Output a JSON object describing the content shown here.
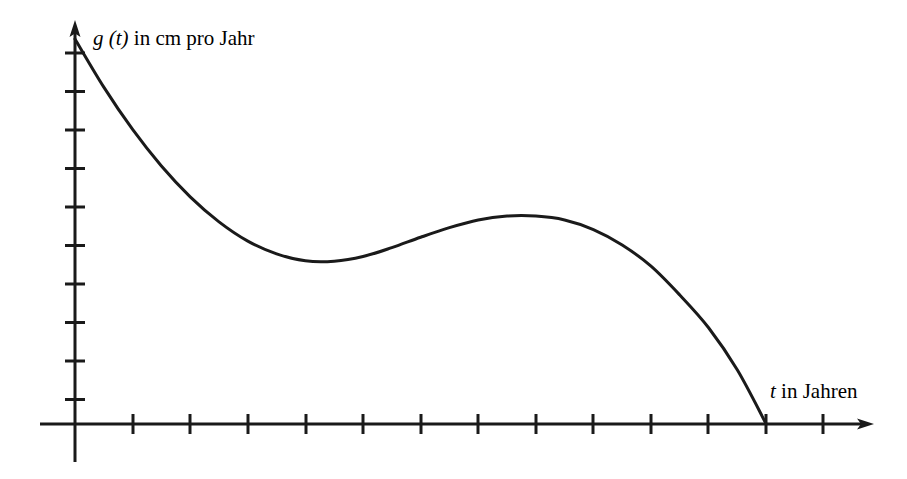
{
  "figure": {
    "background_color": "#ffffff",
    "ink_color": "#1a1a1a",
    "width": 907,
    "height": 479
  },
  "axes": {
    "y_axis": {
      "label_variable": "g (t)",
      "label_rest": " in cm pro Jahr",
      "label_full": "g (t) in cm pro Jahr",
      "has_arrow": true,
      "tick_count": 10
    },
    "x_axis": {
      "label_variable": "t",
      "label_rest": " in Jahren",
      "label_full": "t in Jahren",
      "has_arrow": true,
      "tick_count": 13
    }
  },
  "chart_data": {
    "type": "line",
    "title": "",
    "subtitle": "",
    "xlabel": "t in Jahren",
    "ylabel": "g (t) in cm pro Jahr",
    "legend": [],
    "legend_position": "none",
    "grid": false,
    "axis_tick_labels_shown": false,
    "xlim": [
      0,
      13.85
    ],
    "ylim": [
      0,
      10.43
    ],
    "x_tick_values": [
      1,
      2,
      3,
      4,
      5,
      6,
      7,
      8,
      9,
      10,
      11,
      12,
      13
    ],
    "y_tick_values": [
      1,
      2,
      3,
      4,
      5,
      6,
      7,
      8,
      9,
      10
    ],
    "annotations": [
      {
        "name": "start-value",
        "x": 0,
        "y": 10,
        "note": "Kurvenstart auf der g-Achse"
      },
      {
        "name": "local-minimum",
        "x": 4,
        "y": 4.24,
        "note": "lokales Minimum"
      },
      {
        "name": "local-maximum",
        "x": 8,
        "y": 5.4,
        "note": "lokales Maximum"
      },
      {
        "name": "zero-crossing",
        "x": 12,
        "y": 0,
        "note": "Nullstelle auf der t-Achse"
      }
    ],
    "series": [
      {
        "name": "g",
        "x": [
          0,
          0.5,
          1,
          1.5,
          2,
          2.5,
          3,
          3.5,
          4,
          4.5,
          5,
          5.5,
          6,
          6.5,
          7,
          7.5,
          8,
          8.5,
          9,
          9.5,
          10,
          10.5,
          11,
          11.5,
          12
        ],
        "values": [
          10,
          8.75,
          7.65,
          6.7,
          5.9,
          5.25,
          4.75,
          4.42,
          4.24,
          4.23,
          4.35,
          4.58,
          4.85,
          5.1,
          5.3,
          5.4,
          5.4,
          5.3,
          5.05,
          4.65,
          4.1,
          3.35,
          2.5,
          1.4,
          0
        ]
      }
    ]
  }
}
